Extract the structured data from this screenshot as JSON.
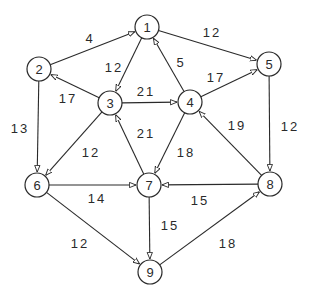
{
  "diagram": {
    "type": "directed-weighted-graph",
    "colors": {
      "stroke": "#2a2a2a",
      "background": "#ffffff"
    },
    "nodes": [
      {
        "id": "1",
        "label": "1",
        "x": 147,
        "y": 27
      },
      {
        "id": "2",
        "label": "2",
        "x": 39,
        "y": 69
      },
      {
        "id": "3",
        "label": "3",
        "x": 110,
        "y": 103
      },
      {
        "id": "4",
        "label": "4",
        "x": 190,
        "y": 102
      },
      {
        "id": "5",
        "label": "5",
        "x": 269,
        "y": 64
      },
      {
        "id": "6",
        "label": "6",
        "x": 37,
        "y": 185
      },
      {
        "id": "7",
        "label": "7",
        "x": 149,
        "y": 185
      },
      {
        "id": "8",
        "label": "8",
        "x": 270,
        "y": 184
      },
      {
        "id": "9",
        "label": "9",
        "x": 150,
        "y": 272
      }
    ],
    "edges": [
      {
        "from": "2",
        "to": "1",
        "weight": "4",
        "lx": 90,
        "ly": 38
      },
      {
        "from": "1",
        "to": "3",
        "weight": "12",
        "lx": 114,
        "ly": 67
      },
      {
        "from": "1",
        "to": "5",
        "weight": "12",
        "lx": 212,
        "ly": 32
      },
      {
        "from": "4",
        "to": "1",
        "weight": "5",
        "lx": 181,
        "ly": 62
      },
      {
        "from": "3",
        "to": "2",
        "weight": "17",
        "lx": 68,
        "ly": 98
      },
      {
        "from": "3",
        "to": "4",
        "weight": "21",
        "lx": 146,
        "ly": 91
      },
      {
        "from": "4",
        "to": "5",
        "weight": "17",
        "lx": 216,
        "ly": 77
      },
      {
        "from": "2",
        "to": "6",
        "weight": "13",
        "lx": 20,
        "ly": 128
      },
      {
        "from": "3",
        "to": "6",
        "weight": "12",
        "lx": 91,
        "ly": 152
      },
      {
        "from": "7",
        "to": "3",
        "weight": "21",
        "lx": 146,
        "ly": 133
      },
      {
        "from": "4",
        "to": "7",
        "weight": "18",
        "lx": 186,
        "ly": 152
      },
      {
        "from": "8",
        "to": "4",
        "weight": "19",
        "lx": 237,
        "ly": 125
      },
      {
        "from": "5",
        "to": "8",
        "weight": "12",
        "lx": 290,
        "ly": 126
      },
      {
        "from": "6",
        "to": "7",
        "weight": "14",
        "lx": 97,
        "ly": 198
      },
      {
        "from": "8",
        "to": "7",
        "weight": "15",
        "lx": 200,
        "ly": 200
      },
      {
        "from": "7",
        "to": "9",
        "weight": "15",
        "lx": 170,
        "ly": 225
      },
      {
        "from": "6",
        "to": "9",
        "weight": "12",
        "lx": 80,
        "ly": 243
      },
      {
        "from": "9",
        "to": "8",
        "weight": "18",
        "lx": 228,
        "ly": 243
      }
    ]
  }
}
